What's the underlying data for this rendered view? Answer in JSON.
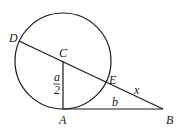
{
  "diagram": {
    "type": "geometry",
    "circle": {
      "center": "C",
      "cx": 63,
      "cy": 61,
      "r": 48
    },
    "points": {
      "A": {
        "label": "A",
        "x": 63,
        "y": 109
      },
      "B": {
        "label": "B",
        "x": 163,
        "y": 109
      },
      "C": {
        "label": "C",
        "x": 63,
        "y": 61
      },
      "D": {
        "label": "D",
        "x": 19,
        "y": 41
      },
      "E": {
        "label": "E",
        "x": 107,
        "y": 82
      }
    },
    "segments": [
      {
        "from": "D",
        "to": "B",
        "note": "secant through C and E"
      },
      {
        "from": "C",
        "to": "A",
        "note": "radius"
      },
      {
        "from": "A",
        "to": "B",
        "note": "tangent"
      }
    ],
    "measures": {
      "CA": {
        "label_num": "a",
        "label_den": "2"
      },
      "AB": {
        "label": "b"
      },
      "EB": {
        "label": "x"
      }
    },
    "colors": {
      "stroke": "#1a1a1a",
      "background": "#ffffff"
    }
  }
}
